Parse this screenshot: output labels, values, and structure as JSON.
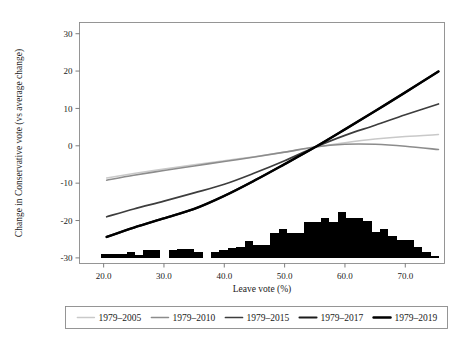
{
  "chart_data": {
    "type": "line",
    "title": "",
    "xlabel": "Leave vote (%)",
    "ylabel": "Change in Conservative vote (vs average change)",
    "xlim": [
      16.0,
      76.5
    ],
    "ylim": [
      -31.5,
      33.0
    ],
    "grid": false,
    "legend_position": "below",
    "xticks": [
      "20.0",
      "30.0",
      "40.0",
      "50.0",
      "60.0",
      "70.0"
    ],
    "xtick_values": [
      20,
      30,
      40,
      50,
      60,
      70
    ],
    "yticks": [
      "30",
      "20",
      "10",
      "0",
      "-10",
      "-20",
      "-30"
    ],
    "ytick_values": [
      30,
      20,
      10,
      0,
      -10,
      -20,
      -30
    ],
    "series": [
      {
        "name": "1979–2005",
        "color": "#c9c9c9",
        "width": 1.5,
        "x": [
          20.5,
          25,
          30,
          35,
          40,
          45,
          50,
          55,
          60,
          65,
          70,
          75.5
        ],
        "values": [
          -8.6,
          -7.4,
          -6.2,
          -5.1,
          -4.0,
          -2.9,
          -1.7,
          -0.4,
          0.8,
          1.8,
          2.5,
          3.0
        ]
      },
      {
        "name": "1979–2010",
        "color": "#8c8c8c",
        "width": 1.6,
        "x": [
          20.5,
          25,
          30,
          35,
          40,
          45,
          50,
          55,
          60,
          65,
          70,
          75.5
        ],
        "values": [
          -9.2,
          -7.9,
          -6.6,
          -5.4,
          -4.2,
          -3.0,
          -1.7,
          -0.3,
          0.4,
          0.4,
          -0.1,
          -1.0
        ]
      },
      {
        "name": "1979–2015",
        "color": "#3d3d3d",
        "width": 1.7,
        "x": [
          20.5,
          25,
          30,
          35,
          40,
          45,
          50,
          55,
          60,
          65,
          70,
          75.5
        ],
        "values": [
          -19.0,
          -16.9,
          -14.8,
          -12.6,
          -10.3,
          -7.3,
          -4.0,
          -0.4,
          2.8,
          5.5,
          8.3,
          11.2
        ]
      },
      {
        "name": "1979–2017",
        "color": "#1c1c1c",
        "width": 2.1,
        "x": [
          20.5,
          25,
          30,
          35,
          40,
          45,
          50,
          55,
          60,
          65,
          70,
          75.5
        ],
        "values": [
          -24.4,
          -21.9,
          -19.4,
          -16.9,
          -13.4,
          -9.3,
          -4.9,
          -0.4,
          4.4,
          9.3,
          14.3,
          19.9
        ]
      },
      {
        "name": "1979–2019",
        "color": "#000000",
        "width": 2.4,
        "x": [
          20.5,
          25,
          30,
          35,
          40,
          45,
          50,
          55,
          60,
          65,
          70,
          75.5
        ],
        "values": [
          -24.4,
          -21.9,
          -19.4,
          -16.9,
          -13.4,
          -9.3,
          -4.9,
          -0.4,
          4.4,
          9.3,
          14.3,
          19.9
        ]
      }
    ],
    "histogram": {
      "name": "Leave vote distribution",
      "color": "#000000",
      "baseline": -30.0,
      "bin_width": 1.4,
      "bins": [
        {
          "x": 20.3,
          "top": -29.0
        },
        {
          "x": 21.7,
          "top": -29.0
        },
        {
          "x": 23.1,
          "top": -29.0
        },
        {
          "x": 24.5,
          "top": -28.3
        },
        {
          "x": 25.9,
          "top": -29.2
        },
        {
          "x": 27.3,
          "top": -27.9
        },
        {
          "x": 28.7,
          "top": -27.9
        },
        {
          "x": 30.1,
          "top": -30.0
        },
        {
          "x": 31.5,
          "top": -28.0
        },
        {
          "x": 32.9,
          "top": -27.6
        },
        {
          "x": 34.3,
          "top": -27.6
        },
        {
          "x": 35.7,
          "top": -28.4
        },
        {
          "x": 37.1,
          "top": -30.0
        },
        {
          "x": 38.5,
          "top": -28.4
        },
        {
          "x": 39.9,
          "top": -27.9
        },
        {
          "x": 41.3,
          "top": -27.4
        },
        {
          "x": 42.7,
          "top": -27.0
        },
        {
          "x": 44.1,
          "top": -25.6
        },
        {
          "x": 45.5,
          "top": -26.5
        },
        {
          "x": 46.9,
          "top": -26.5
        },
        {
          "x": 48.3,
          "top": -23.3
        },
        {
          "x": 49.7,
          "top": -22.4
        },
        {
          "x": 51.1,
          "top": -23.3
        },
        {
          "x": 52.5,
          "top": -23.3
        },
        {
          "x": 53.9,
          "top": -20.3
        },
        {
          "x": 55.3,
          "top": -20.3
        },
        {
          "x": 56.7,
          "top": -19.2
        },
        {
          "x": 58.1,
          "top": -20.3
        },
        {
          "x": 59.5,
          "top": -17.8
        },
        {
          "x": 60.9,
          "top": -19.2
        },
        {
          "x": 62.3,
          "top": -19.2
        },
        {
          "x": 63.7,
          "top": -20.1
        },
        {
          "x": 65.1,
          "top": -23.0
        },
        {
          "x": 66.5,
          "top": -22.4
        },
        {
          "x": 67.9,
          "top": -24.2
        },
        {
          "x": 69.3,
          "top": -25.2
        },
        {
          "x": 70.7,
          "top": -25.2
        },
        {
          "x": 72.1,
          "top": -27.2
        },
        {
          "x": 73.5,
          "top": -28.4
        },
        {
          "x": 74.9,
          "top": -29.4
        }
      ]
    }
  },
  "legend": {
    "items": [
      {
        "label": "1979–2005"
      },
      {
        "label": "1979–2010"
      },
      {
        "label": "1979–2015"
      },
      {
        "label": "1979–2017"
      },
      {
        "label": "1979–2019"
      }
    ]
  }
}
